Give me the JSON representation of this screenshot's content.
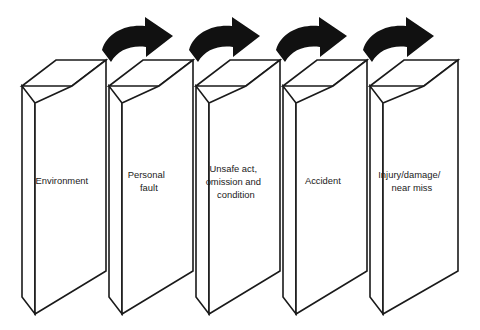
{
  "diagram": {
    "type": "domino-sequence",
    "background_color": "#ffffff",
    "line_color": "#1a1a1a",
    "arrow_color": "#111111",
    "block_fill": "#ffffff",
    "block_count": 5,
    "arrow_count": 4,
    "blocks": [
      {
        "id": "block-1",
        "name": "environment",
        "label": "Environment",
        "lines": [
          "Environment"
        ]
      },
      {
        "id": "block-2",
        "name": "personal-fault",
        "label": "Personal fault",
        "lines": [
          "Personal",
          "fault"
        ]
      },
      {
        "id": "block-3",
        "name": "unsafe-act-omission-condition",
        "label": "Unsafe act, omission and condition",
        "lines": [
          "Unsafe act,",
          "omission and",
          "condition"
        ]
      },
      {
        "id": "block-4",
        "name": "accident",
        "label": "Accident",
        "lines": [
          "Accident"
        ]
      },
      {
        "id": "block-5",
        "name": "injury-damage-near-miss",
        "label": "Injury/damage/ near miss",
        "lines": [
          "Injury/damage/",
          "near miss"
        ]
      }
    ],
    "arrows": [
      {
        "id": "arrow-1",
        "name": "arrow-environment-to-personal-fault",
        "from": "Environment",
        "to": "Personal fault",
        "style": "curved-right"
      },
      {
        "id": "arrow-2",
        "name": "arrow-personal-fault-to-unsafe-act",
        "from": "Personal fault",
        "to": "Unsafe act, omission and condition",
        "style": "curved-right"
      },
      {
        "id": "arrow-3",
        "name": "arrow-unsafe-act-to-accident",
        "from": "Unsafe act, omission and condition",
        "to": "Accident",
        "style": "curved-right"
      },
      {
        "id": "arrow-4",
        "name": "arrow-accident-to-injury",
        "from": "Accident",
        "to": "Injury/damage/ near miss",
        "style": "curved-right"
      }
    ]
  }
}
